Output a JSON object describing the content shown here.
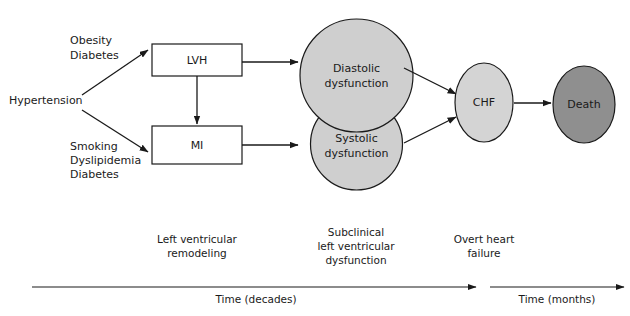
{
  "diagram": {
    "risk_factors": {
      "primary": "Hypertension",
      "upper_group": [
        "Obesity",
        "Diabetes"
      ],
      "lower_group": [
        "Smoking",
        "Dyslipidemia",
        "Diabetes"
      ]
    },
    "boxes": [
      {
        "id": "lvh",
        "label": "LVH"
      },
      {
        "id": "mi",
        "label": "MI"
      }
    ],
    "circles": [
      {
        "id": "diastolic",
        "line1": "Diastolic",
        "line2": "dysfunction",
        "fill": "#cfcfcf"
      },
      {
        "id": "systolic",
        "line1": "Systolic",
        "line2": "dysfunction",
        "fill": "#cfcfcf"
      }
    ],
    "outcomes": [
      {
        "id": "chf",
        "label": "CHF",
        "fill": "#d4d4d4"
      },
      {
        "id": "death",
        "label": "Death",
        "fill": "#8f8f8f"
      }
    ],
    "stages": [
      {
        "id": "stage-remodeling",
        "lines": [
          "Left ventricular",
          "remodeling"
        ]
      },
      {
        "id": "stage-subclinical",
        "lines": [
          "Subclinical",
          "left ventricular",
          "dysfunction"
        ]
      },
      {
        "id": "stage-overt",
        "lines": [
          "Overt heart",
          "failure"
        ]
      }
    ],
    "timelines": [
      {
        "id": "timeline-decades",
        "label": "Time (decades)"
      },
      {
        "id": "timeline-months",
        "label": "Time (months)"
      }
    ],
    "colors": {
      "stroke": "#1a1a1a",
      "background": "#ffffff",
      "circle_fill": "#cfcfcf",
      "chf_fill": "#d4d4d4",
      "death_fill": "#8f8f8f"
    }
  }
}
